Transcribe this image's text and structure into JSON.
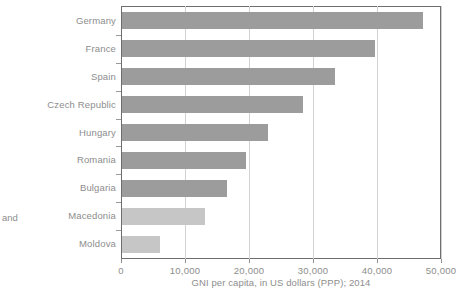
{
  "chart_data": {
    "type": "bar",
    "orientation": "horizontal",
    "title": "",
    "xlabel": "GNI per capita, in US dollars (PPP); 2014",
    "ylabel": "",
    "categories": [
      "Germany",
      "France",
      "Spain",
      "Czech Republic",
      "Hungary",
      "Romania",
      "Bulgaria",
      "Macedonia",
      "Moldova"
    ],
    "values": [
      47000,
      39500,
      33300,
      28300,
      22800,
      19400,
      16400,
      13000,
      5900
    ],
    "bar_colors": [
      "#9c9c9c",
      "#9c9c9c",
      "#9c9c9c",
      "#9c9c9c",
      "#9c9c9c",
      "#9c9c9c",
      "#9c9c9c",
      "#c6c6c6",
      "#c6c6c6"
    ],
    "xlim": [
      0,
      50000
    ],
    "xticks": [
      0,
      10000,
      20000,
      30000,
      40000,
      50000
    ],
    "xtick_labels": [
      "0",
      "10,000",
      "20,000",
      "30,000",
      "40,000",
      "50,000"
    ],
    "grid": true,
    "grid_axis": "x",
    "legend": "none"
  },
  "annotations": {
    "side_note": "and",
    "source_note": ""
  },
  "colors": {
    "bar_dark": "#9c9c9c",
    "bar_light": "#c6c6c6",
    "gridline": "#d2d2d2",
    "axis": "#6e6e6e",
    "text": "#8d8d8d"
  }
}
